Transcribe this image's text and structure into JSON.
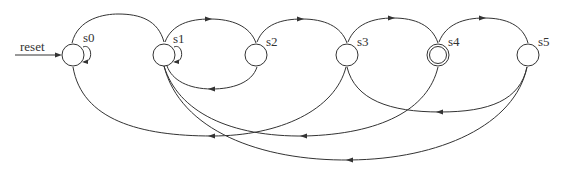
{
  "diagram": {
    "type": "state-machine",
    "reset_label": "reset",
    "colors": {
      "stroke": "#333333",
      "background": "#ffffff"
    },
    "states": [
      {
        "id": "s0",
        "label": "s0",
        "accepting": false,
        "initial": true
      },
      {
        "id": "s1",
        "label": "s1",
        "accepting": false
      },
      {
        "id": "s2",
        "label": "s2",
        "accepting": false
      },
      {
        "id": "s3",
        "label": "s3",
        "accepting": false
      },
      {
        "id": "s4",
        "label": "s4",
        "accepting": true
      },
      {
        "id": "s5",
        "label": "s5",
        "accepting": false
      }
    ],
    "transitions": [
      {
        "from": "reset",
        "to": "s0"
      },
      {
        "from": "s0",
        "to": "s0"
      },
      {
        "from": "s0",
        "to": "s1"
      },
      {
        "from": "s1",
        "to": "s1"
      },
      {
        "from": "s1",
        "to": "s2"
      },
      {
        "from": "s2",
        "to": "s1"
      },
      {
        "from": "s2",
        "to": "s3"
      },
      {
        "from": "s3",
        "to": "s4"
      },
      {
        "from": "s4",
        "to": "s5"
      },
      {
        "from": "s3",
        "to": "s0"
      },
      {
        "from": "s4",
        "to": "s1"
      },
      {
        "from": "s5",
        "to": "s3"
      },
      {
        "from": "s5",
        "to": "s1"
      }
    ]
  }
}
